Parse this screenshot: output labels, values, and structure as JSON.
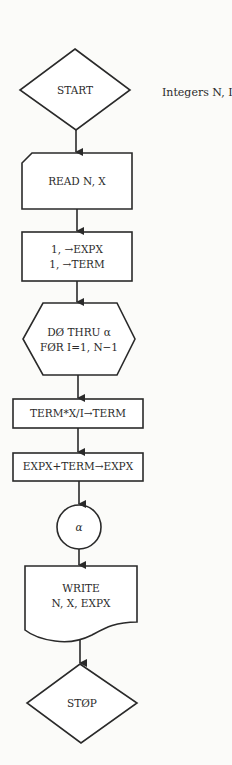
{
  "diagram": {
    "type": "flowchart",
    "annotation": "Integers N, I",
    "nodes": [
      {
        "id": "start",
        "shape": "diamond",
        "lines": [
          "START"
        ]
      },
      {
        "id": "read",
        "shape": "card",
        "lines": [
          "READ N, X"
        ]
      },
      {
        "id": "init",
        "shape": "rectangle",
        "lines": [
          "1, →EXPX",
          "1, →TERM"
        ]
      },
      {
        "id": "loop",
        "shape": "hexagon",
        "lines": [
          "DØ THRU α",
          "FØR I=1, N−1"
        ]
      },
      {
        "id": "term",
        "shape": "rectangle",
        "lines": [
          "TERM*X/I→TERM"
        ]
      },
      {
        "id": "sum",
        "shape": "rectangle",
        "lines": [
          "EXPX+TERM→EXPX"
        ]
      },
      {
        "id": "connector",
        "shape": "circle",
        "lines": [
          "α"
        ]
      },
      {
        "id": "write",
        "shape": "document",
        "lines": [
          "WRITE",
          "N, X, EXPX"
        ]
      },
      {
        "id": "stop",
        "shape": "diamond",
        "lines": [
          "STØP"
        ]
      }
    ],
    "edges": [
      [
        "start",
        "read"
      ],
      [
        "read",
        "init"
      ],
      [
        "init",
        "loop"
      ],
      [
        "loop",
        "term"
      ],
      [
        "term",
        "sum"
      ],
      [
        "sum",
        "connector"
      ],
      [
        "connector",
        "write"
      ],
      [
        "write",
        "stop"
      ]
    ],
    "colors": {
      "stroke": "#2a2a2a",
      "background": "#fbfbf9",
      "fill": "#ffffff"
    }
  }
}
